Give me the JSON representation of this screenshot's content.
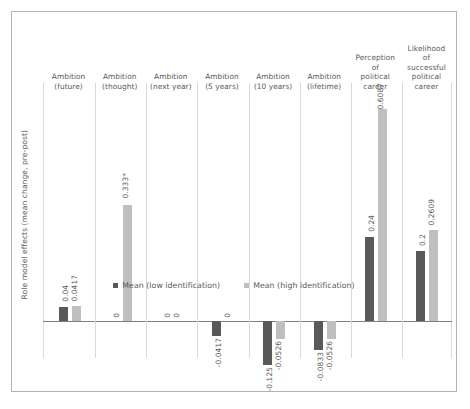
{
  "chart_data": {
    "type": "bar",
    "title": "",
    "xlabel": "",
    "ylabel": "Role model effects (mean change, pre-post)",
    "ylim": [
      -0.13,
      0.66
    ],
    "grid": "vertical category separators only",
    "legend_position": "bottom-center",
    "zero_reference_line": true,
    "categories": [
      "Ambition (future)",
      "Ambition (thought)",
      "Ambition (next year)",
      "Ambition (5 years)",
      "Ambition (10 years)",
      "Ambition (lifetime)",
      "Perception of political career",
      "Likelihood of successful political career"
    ],
    "category_lines": [
      [
        "Ambition",
        "(future)"
      ],
      [
        "Ambition",
        "(thought)"
      ],
      [
        "Ambition",
        "(next year)"
      ],
      [
        "Ambition",
        "(5 years)"
      ],
      [
        "Ambition",
        "(10 years)"
      ],
      [
        "Ambition",
        "(lifetime)"
      ],
      [
        "Perception",
        "of",
        "political",
        "career"
      ],
      [
        "Likelihood",
        "of",
        "successful",
        "political",
        "career"
      ]
    ],
    "series": [
      {
        "name": "Mean (low identification)",
        "color": "#595959",
        "values": [
          0.04,
          0,
          0,
          -0.0417,
          -0.125,
          -0.0833,
          0.24,
          0.2
        ],
        "labels": [
          "0.04",
          "0",
          "0",
          "-0.0417",
          "-0.125",
          "-0.0833",
          "0.24",
          "0.2"
        ]
      },
      {
        "name": "Mean (high identification)",
        "color": "#bfbfbf",
        "values": [
          0.0417,
          0.333,
          0,
          0,
          -0.0526,
          -0.0526,
          0.6087,
          0.2609
        ],
        "labels": [
          "0.0417",
          "0.333*",
          "0",
          "0",
          "-0.0526",
          "-0.0526",
          "0.6087",
          "0.2609"
        ]
      }
    ]
  }
}
